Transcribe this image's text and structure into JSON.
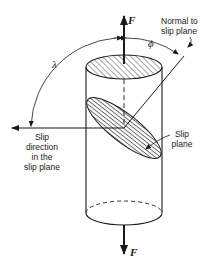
{
  "diagram": {
    "type": "schematic",
    "labels": {
      "force_top": "F",
      "force_bottom": "F",
      "normal_label_line1": "Normal to",
      "normal_label_line2": "slip plane",
      "phi": "ϕ",
      "lambda": "λ",
      "slip_direction_line1": "Slip",
      "slip_direction_line2": "direction",
      "slip_direction_line3": "in the",
      "slip_direction_line4": "slip plane",
      "slip_plane_line1": "Slip",
      "slip_plane_line2": "plane"
    },
    "elements": [
      "cylinder",
      "hatched-top-face",
      "hatched-inclined-slip-plane",
      "axial-force-arrows",
      "normal-to-slip-plane-line",
      "slip-direction-arrow",
      "angle-arc-phi",
      "angle-arc-lambda"
    ],
    "colors": {
      "ink": "#1a1a1a",
      "background": "#ffffff"
    }
  }
}
